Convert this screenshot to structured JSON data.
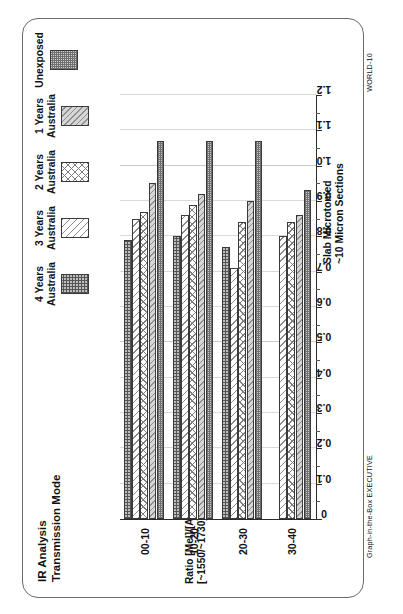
{
  "card": {
    "world_code": "WORLD-10",
    "brand_code": "Graph-in-the-Box EXECUTIVE"
  },
  "chart_data": {
    "type": "bar",
    "orientation": "horizontal",
    "title": "IR Analysis",
    "subtitle": "Transmission Mode",
    "xlabel": "Slab Microtomed",
    "xlabel2": "~10 Micron Sections",
    "ylabel": "Ratio [Mel]/[Acryl]",
    "ylabel2": "[~1550/~1730]cm-1",
    "categories": [
      "00-10",
      "10-20",
      "20-30",
      "30-40"
    ],
    "ylim": [
      0,
      1.2
    ],
    "ticks": [
      "1.2",
      "1.1",
      "1.0",
      "0.9",
      "0.8",
      "0.7",
      "0.6",
      "0.5",
      "0.4",
      "0.3",
      "0.2",
      "0.1",
      "0"
    ],
    "tick_values": [
      1.2,
      1.1,
      1.0,
      0.9,
      0.8,
      0.7,
      0.6,
      0.5,
      0.4,
      0.3,
      0.2,
      0.1,
      0
    ],
    "grid": true,
    "legend_position": "top-right",
    "series": [
      {
        "name": "4 Years",
        "name2": "Australia",
        "fill": "fill-grid-dark",
        "values": [
          0.79,
          0.8,
          0.77,
          null
        ]
      },
      {
        "name": "3 Years",
        "name2": "Australia",
        "fill": "fill-diag-light",
        "values": [
          0.85,
          0.86,
          0.71,
          0.8
        ]
      },
      {
        "name": "2 Years",
        "name2": "Australia",
        "fill": "fill-cross",
        "values": [
          0.87,
          0.89,
          0.84,
          0.84
        ]
      },
      {
        "name": "1 Years",
        "name2": "Australia",
        "fill": "fill-diag-grey",
        "values": [
          0.95,
          0.92,
          0.9,
          0.86
        ]
      },
      {
        "name": "Unexposed",
        "name2": "",
        "fill": "fill-dot",
        "values": [
          1.07,
          1.07,
          1.07,
          0.93
        ]
      }
    ]
  }
}
